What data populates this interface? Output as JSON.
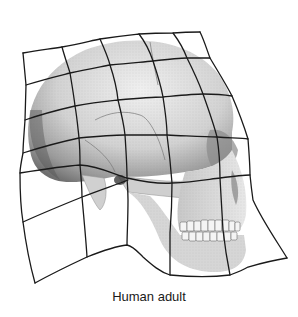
{
  "figure": {
    "overlay": "deformed Cartesian transformation grid",
    "caption": "Human adult",
    "colors": {
      "grid_line": "#1a1a1a",
      "skull_light": "#e6e6e6",
      "skull_mid": "#b8b8b8",
      "skull_dark": "#6e6e6e",
      "background": "#ffffff"
    },
    "grid": {
      "columns": 5,
      "rows_full": 5,
      "horizontal_lines": [
        [
          [
            23,
            53
          ],
          [
            62,
            47
          ],
          [
            100,
            39
          ],
          [
            139,
            34
          ],
          [
            173,
            33
          ],
          [
            200,
            32
          ]
        ],
        [
          [
            26,
            85
          ],
          [
            70,
            73
          ],
          [
            110,
            65
          ],
          [
            153,
            61
          ],
          [
            187,
            58
          ],
          [
            210,
            58
          ]
        ],
        [
          [
            25,
            120
          ],
          [
            75,
            106
          ],
          [
            118,
            100
          ],
          [
            163,
            97
          ],
          [
            203,
            94
          ],
          [
            232,
            96
          ]
        ],
        [
          [
            23,
            153
          ],
          [
            79,
            138
          ],
          [
            125,
            135
          ],
          [
            167,
            135
          ],
          [
            217,
            137
          ],
          [
            248,
            139
          ]
        ],
        [
          [
            20,
            173
          ],
          [
            80,
            165
          ],
          [
            127,
            178
          ],
          [
            172,
            183
          ],
          [
            220,
            178
          ],
          [
            250,
            175
          ]
        ],
        [
          [
            23,
            222
          ],
          [
            82,
            197
          ],
          [
            128,
            180
          ]
        ]
      ],
      "vertical_lines": [
        [
          [
            23,
            53
          ],
          [
            26,
            85
          ],
          [
            25,
            120
          ],
          [
            23,
            153
          ],
          [
            20,
            173
          ],
          [
            23,
            222
          ],
          [
            35,
            283
          ]
        ],
        [
          [
            62,
            47
          ],
          [
            70,
            73
          ],
          [
            75,
            106
          ],
          [
            79,
            138
          ],
          [
            80,
            165
          ],
          [
            82,
            197
          ],
          [
            87,
            257
          ]
        ],
        [
          [
            100,
            39
          ],
          [
            110,
            65
          ],
          [
            118,
            100
          ],
          [
            125,
            135
          ],
          [
            127,
            178
          ],
          [
            128,
            200
          ],
          [
            127,
            245
          ]
        ],
        [
          [
            139,
            34
          ],
          [
            153,
            61
          ],
          [
            163,
            97
          ],
          [
            167,
            135
          ],
          [
            172,
            183
          ],
          [
            170,
            233
          ],
          [
            170,
            275
          ]
        ],
        [
          [
            173,
            33
          ],
          [
            187,
            58
          ],
          [
            203,
            94
          ],
          [
            217,
            137
          ],
          [
            220,
            178
          ],
          [
            223,
            230
          ],
          [
            230,
            275
          ]
        ],
        [
          [
            200,
            32
          ],
          [
            210,
            58
          ],
          [
            232,
            96
          ],
          [
            248,
            139
          ],
          [
            250,
            175
          ],
          [
            253,
            200
          ],
          [
            287,
            258
          ]
        ]
      ],
      "bottom_edge": [
        [
          35,
          283
        ],
        [
          87,
          257
        ],
        [
          127,
          245
        ],
        [
          143,
          257
        ],
        [
          170,
          275
        ],
        [
          230,
          275
        ],
        [
          248,
          267
        ],
        [
          287,
          258
        ]
      ]
    }
  }
}
